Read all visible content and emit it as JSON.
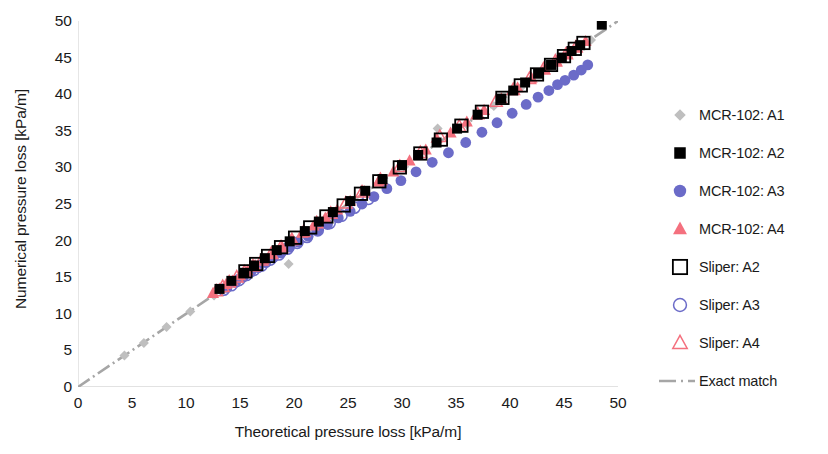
{
  "chart_data": {
    "type": "scatter",
    "title": "",
    "xlabel": "Theoretical pressure loss [kPa/m]",
    "ylabel": "Numerical pressure loss [kPa/m]",
    "xlim": [
      0,
      50
    ],
    "ylim": [
      0,
      50
    ],
    "xticks": [
      "0",
      "5",
      "10",
      "15",
      "20",
      "25",
      "30",
      "35",
      "40",
      "45",
      "50"
    ],
    "yticks": [
      "0",
      "5",
      "10",
      "15",
      "20",
      "25",
      "30",
      "35",
      "40",
      "45",
      "50"
    ],
    "grid": false,
    "legend_position": "right",
    "colors": {
      "a1_gray": "#BFBFBF",
      "a2_black": "#000000",
      "a3_blue": "#6B6BC8",
      "a4_red": "#F4707E",
      "exact_match_line": "#A6A6A6",
      "axis": "#D9D9D9",
      "text": "#1A1A1A"
    },
    "series": [
      {
        "name": "MCR-102: A1",
        "marker": "diamond-filled",
        "color": "#BFBFBF",
        "points": [
          [
            4.3,
            4.3
          ],
          [
            6.1,
            6.0
          ],
          [
            8.2,
            8.2
          ],
          [
            10.4,
            10.3
          ],
          [
            12.6,
            12.5
          ],
          [
            14.8,
            14.7
          ],
          [
            17.0,
            16.9
          ],
          [
            19.5,
            16.8
          ],
          [
            21.3,
            21.2
          ],
          [
            23.4,
            23.3
          ],
          [
            25.6,
            25.5
          ],
          [
            28.0,
            27.9
          ],
          [
            30.2,
            30.1
          ],
          [
            33.3,
            35.3
          ],
          [
            36.0,
            35.9
          ],
          [
            38.5,
            38.4
          ],
          [
            41.0,
            40.9
          ],
          [
            43.5,
            43.4
          ],
          [
            45.5,
            45.4
          ],
          [
            47.5,
            47.4
          ]
        ]
      },
      {
        "name": "MCR-102: A2",
        "marker": "square-filled",
        "color": "#000000",
        "points": [
          [
            13.1,
            13.4
          ],
          [
            14.2,
            14.5
          ],
          [
            15.4,
            15.6
          ],
          [
            16.3,
            16.6
          ],
          [
            17.3,
            17.6
          ],
          [
            18.4,
            18.7
          ],
          [
            19.6,
            19.9
          ],
          [
            21.0,
            21.3
          ],
          [
            22.3,
            22.6
          ],
          [
            23.6,
            23.9
          ],
          [
            25.2,
            25.4
          ],
          [
            26.6,
            26.8
          ],
          [
            28.2,
            28.4
          ],
          [
            30.0,
            30.3
          ],
          [
            31.5,
            31.7
          ],
          [
            33.2,
            33.4
          ],
          [
            35.1,
            35.3
          ],
          [
            37.0,
            37.2
          ],
          [
            39.2,
            39.4
          ],
          [
            40.3,
            40.5
          ],
          [
            41.4,
            41.6
          ],
          [
            42.6,
            42.8
          ],
          [
            43.8,
            44.0
          ],
          [
            44.8,
            45.0
          ],
          [
            45.7,
            45.9
          ],
          [
            46.5,
            46.7
          ],
          [
            48.5,
            49.5
          ]
        ]
      },
      {
        "name": "MCR-102: A3",
        "marker": "circle-filled",
        "color": "#6B6BC8",
        "points": [
          [
            13.8,
            13.6
          ],
          [
            14.6,
            14.3
          ],
          [
            15.3,
            15.0
          ],
          [
            16.0,
            15.7
          ],
          [
            16.7,
            16.3
          ],
          [
            17.4,
            17.0
          ],
          [
            18.1,
            17.7
          ],
          [
            18.8,
            18.3
          ],
          [
            19.6,
            19.1
          ],
          [
            20.4,
            19.8
          ],
          [
            21.3,
            20.6
          ],
          [
            22.2,
            21.4
          ],
          [
            23.1,
            22.2
          ],
          [
            24.1,
            23.1
          ],
          [
            25.2,
            24.0
          ],
          [
            26.3,
            25.0
          ],
          [
            27.4,
            26.0
          ],
          [
            28.6,
            27.1
          ],
          [
            29.9,
            28.2
          ],
          [
            31.3,
            29.4
          ],
          [
            32.8,
            30.7
          ],
          [
            34.3,
            32.0
          ],
          [
            35.9,
            33.4
          ],
          [
            37.4,
            34.8
          ],
          [
            38.8,
            36.1
          ],
          [
            40.2,
            37.4
          ],
          [
            41.5,
            38.6
          ],
          [
            42.6,
            39.6
          ],
          [
            43.6,
            40.5
          ],
          [
            44.4,
            41.3
          ],
          [
            45.1,
            41.9
          ],
          [
            45.9,
            42.6
          ],
          [
            46.6,
            43.3
          ],
          [
            47.2,
            44.0
          ]
        ]
      },
      {
        "name": "MCR-102: A4",
        "marker": "triangle-filled",
        "color": "#F4707E",
        "points": [
          [
            12.5,
            12.8
          ],
          [
            13.1,
            13.4
          ],
          [
            13.7,
            14.0
          ],
          [
            14.3,
            14.5
          ],
          [
            15.0,
            15.2
          ],
          [
            15.7,
            15.9
          ],
          [
            16.4,
            16.6
          ],
          [
            17.2,
            17.4
          ],
          [
            18.0,
            18.2
          ],
          [
            18.9,
            19.1
          ],
          [
            19.8,
            20.0
          ],
          [
            20.8,
            21.0
          ],
          [
            21.8,
            22.0
          ],
          [
            22.9,
            23.1
          ],
          [
            24.0,
            24.2
          ],
          [
            25.2,
            25.4
          ],
          [
            26.5,
            26.7
          ],
          [
            27.8,
            28.0
          ],
          [
            29.2,
            29.4
          ],
          [
            30.7,
            30.9
          ],
          [
            32.2,
            32.4
          ],
          [
            33.2,
            34.0
          ],
          [
            34.5,
            34.7
          ],
          [
            36.0,
            36.2
          ],
          [
            37.6,
            37.8
          ],
          [
            39.2,
            39.4
          ],
          [
            40.7,
            40.9
          ],
          [
            42.0,
            42.2
          ],
          [
            43.2,
            43.4
          ],
          [
            44.3,
            44.5
          ],
          [
            45.3,
            45.5
          ],
          [
            46.2,
            46.4
          ],
          [
            47.0,
            47.2
          ]
        ]
      },
      {
        "name": "Sliper: A2",
        "marker": "square-open",
        "color": "#000000",
        "points": [
          [
            15.5,
            15.8
          ],
          [
            16.5,
            16.8
          ],
          [
            17.6,
            17.9
          ],
          [
            18.8,
            19.1
          ],
          [
            20.1,
            20.4
          ],
          [
            21.5,
            21.8
          ],
          [
            23.0,
            23.3
          ],
          [
            24.6,
            24.8
          ],
          [
            26.2,
            26.4
          ],
          [
            27.9,
            28.1
          ],
          [
            29.8,
            30.0
          ],
          [
            31.7,
            31.9
          ],
          [
            33.6,
            33.8
          ],
          [
            35.5,
            35.7
          ],
          [
            37.4,
            37.6
          ],
          [
            39.3,
            39.5
          ],
          [
            41.0,
            41.2
          ],
          [
            42.5,
            42.7
          ],
          [
            43.8,
            44.0
          ],
          [
            45.0,
            45.2
          ],
          [
            46.0,
            46.2
          ],
          [
            46.8,
            47.0
          ]
        ]
      },
      {
        "name": "Sliper: A3",
        "marker": "circle-open",
        "color": "#6B6BC8",
        "points": [
          [
            13.5,
            13.3
          ],
          [
            14.2,
            13.9
          ],
          [
            14.9,
            14.6
          ],
          [
            15.6,
            15.3
          ],
          [
            16.3,
            16.0
          ],
          [
            17.0,
            16.6
          ],
          [
            17.8,
            17.4
          ],
          [
            18.6,
            18.1
          ],
          [
            19.4,
            18.9
          ],
          [
            20.3,
            19.7
          ],
          [
            21.2,
            20.5
          ],
          [
            22.2,
            21.4
          ],
          [
            23.3,
            22.4
          ],
          [
            24.4,
            23.4
          ],
          [
            25.6,
            24.5
          ],
          [
            26.9,
            25.7
          ]
        ]
      },
      {
        "name": "Sliper: A4",
        "marker": "triangle-open",
        "color": "#F4707E",
        "points": [
          [
            12.8,
            13.1
          ],
          [
            13.4,
            13.7
          ],
          [
            14.0,
            14.3
          ],
          [
            14.7,
            15.0
          ],
          [
            15.4,
            15.7
          ],
          [
            16.2,
            16.5
          ],
          [
            17.0,
            17.3
          ],
          [
            17.9,
            18.2
          ],
          [
            18.8,
            19.1
          ],
          [
            19.8,
            20.1
          ],
          [
            20.9,
            21.2
          ],
          [
            22.1,
            22.4
          ],
          [
            23.4,
            23.7
          ],
          [
            24.8,
            25.1
          ],
          [
            26.3,
            26.6
          ],
          [
            28.0,
            28.3
          ],
          [
            29.8,
            30.1
          ],
          [
            31.7,
            32.0
          ],
          [
            33.5,
            34.2
          ],
          [
            35.3,
            35.6
          ],
          [
            37.0,
            37.3
          ],
          [
            38.7,
            39.0
          ],
          [
            40.3,
            40.6
          ],
          [
            41.8,
            42.1
          ],
          [
            43.1,
            43.4
          ],
          [
            44.2,
            44.5
          ],
          [
            45.2,
            45.5
          ],
          [
            46.1,
            46.4
          ]
        ]
      },
      {
        "name": "Exact match",
        "marker": "line-dashdot",
        "color": "#A6A6A6",
        "points": [
          [
            0,
            0
          ],
          [
            50,
            50
          ]
        ]
      }
    ]
  },
  "axes": {
    "x_title": "Theoretical pressure loss [kPa/m]",
    "y_title": "Numerical pressure loss [kPa/m]"
  },
  "legend": {
    "items": [
      {
        "label": "MCR-102: A1",
        "marker": "diamond-filled",
        "color": "#BFBFBF"
      },
      {
        "label": "MCR-102: A2",
        "marker": "square-filled",
        "color": "#000000"
      },
      {
        "label": "MCR-102: A3",
        "marker": "circle-filled",
        "color": "#6B6BC8"
      },
      {
        "label": "MCR-102: A4",
        "marker": "triangle-filled",
        "color": "#F4707E"
      },
      {
        "label": "Sliper: A2",
        "marker": "square-open",
        "color": "#000000"
      },
      {
        "label": "Sliper: A3",
        "marker": "circle-open",
        "color": "#6B6BC8"
      },
      {
        "label": "Sliper: A4",
        "marker": "triangle-open",
        "color": "#F4707E"
      },
      {
        "label": "Exact match",
        "marker": "line-dashdot",
        "color": "#A6A6A6"
      }
    ]
  }
}
